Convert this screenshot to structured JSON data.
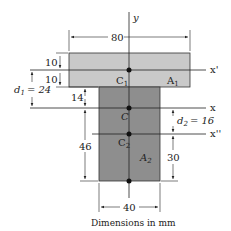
{
  "diagram": {
    "caption": "Dimensions in mm",
    "colors": {
      "flange": "#c9c9c9",
      "web": "#8e8e8e",
      "line": "#222222"
    },
    "axes": {
      "y": "y",
      "x": "x",
      "x_prime": "x'",
      "x_double_prime": "x''"
    },
    "points": {
      "C1": "C",
      "C1_sub": "1",
      "C": "C",
      "C2": "C",
      "C2_sub": "2"
    },
    "areas": {
      "A1": "A",
      "A1_sub": "1",
      "A2": "A",
      "A2_sub": "2"
    },
    "dimensions": {
      "flange_width": "80",
      "flange_top_half": "10",
      "flange_bottom_half": "10",
      "d1_label": "d",
      "d1_sub": "1",
      "d1_value": "= 24",
      "web_top_to_C": "14",
      "C_to_bottom": "46",
      "d2_label": "d",
      "d2_sub": "2",
      "d2_value": "= 16",
      "C2_to_bottom": "30",
      "web_width": "40"
    }
  }
}
